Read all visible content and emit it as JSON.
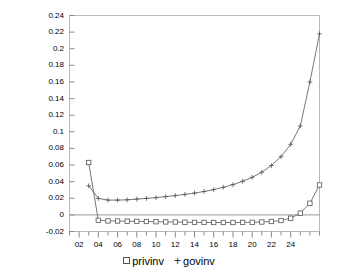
{
  "chart_data": {
    "type": "line",
    "title": "",
    "subtitle": "",
    "xlabel": "",
    "ylabel": "",
    "xlim": [
      1,
      27
    ],
    "ylim": [
      -0.02,
      0.24
    ],
    "grid": false,
    "legend_position": "bottom-center",
    "zero_line": 0,
    "x": [
      1,
      2,
      3,
      4,
      5,
      6,
      7,
      8,
      9,
      10,
      11,
      12,
      13,
      14,
      15,
      16,
      17,
      18,
      19,
      20,
      21,
      22,
      23,
      24,
      25,
      26,
      27
    ],
    "ytick_labels": [
      "0.24",
      "0.22",
      "0.2",
      "0.18",
      "0.16",
      "0.14",
      "0.12",
      "0.1",
      "0.08",
      "0.06",
      "0.04",
      "0.02",
      "0",
      "-0.02"
    ],
    "ytick_values": [
      0.24,
      0.22,
      0.2,
      0.18,
      0.16,
      0.14,
      0.12,
      0.1,
      0.08,
      0.06,
      0.04,
      0.02,
      0,
      -0.02
    ],
    "xtick_labels": [
      "02",
      "04",
      "06",
      "08",
      "10",
      "12",
      "14",
      "16",
      "18",
      "20",
      "22",
      "24"
    ],
    "xtick_values": [
      2,
      4,
      6,
      8,
      10,
      12,
      14,
      16,
      18,
      20,
      22,
      24
    ],
    "series": [
      {
        "name": "privinv",
        "marker": "square",
        "color": "#555555",
        "x": [
          3,
          4,
          5,
          6,
          7,
          8,
          9,
          10,
          11,
          12,
          13,
          14,
          15,
          16,
          17,
          18,
          19,
          20,
          21,
          22,
          23,
          24,
          25,
          26,
          27
        ],
        "values": [
          0.063,
          -0.0065,
          -0.0072,
          -0.0074,
          -0.0076,
          -0.0078,
          -0.008,
          -0.0082,
          -0.0084,
          -0.0086,
          -0.0088,
          -0.009,
          -0.0091,
          -0.0092,
          -0.0092,
          -0.0092,
          -0.0091,
          -0.0089,
          -0.0086,
          -0.008,
          -0.0068,
          -0.004,
          0.002,
          0.014,
          0.036
        ]
      },
      {
        "name": "govinv",
        "marker": "plus",
        "color": "#555555",
        "x": [
          3,
          4,
          5,
          6,
          7,
          8,
          9,
          10,
          11,
          12,
          13,
          14,
          15,
          16,
          17,
          18,
          19,
          20,
          21,
          22,
          23,
          24,
          25,
          26,
          27
        ],
        "values": [
          0.035,
          0.0198,
          0.0178,
          0.0178,
          0.0182,
          0.019,
          0.0198,
          0.0208,
          0.022,
          0.0232,
          0.0246,
          0.0262,
          0.0282,
          0.0304,
          0.0332,
          0.0364,
          0.0404,
          0.0452,
          0.0514,
          0.0594,
          0.07,
          0.085,
          0.107,
          0.16,
          0.218
        ]
      }
    ]
  },
  "legend": {
    "entries": [
      {
        "label": "privinv",
        "marker": "square"
      },
      {
        "label": "govinv",
        "marker": "plus"
      }
    ]
  },
  "axes": {
    "frame_color": "#b9b9b9",
    "zero_line_color": "#9a9a9a",
    "tick_color": "#8a8a8a",
    "line_color": "#555555"
  }
}
